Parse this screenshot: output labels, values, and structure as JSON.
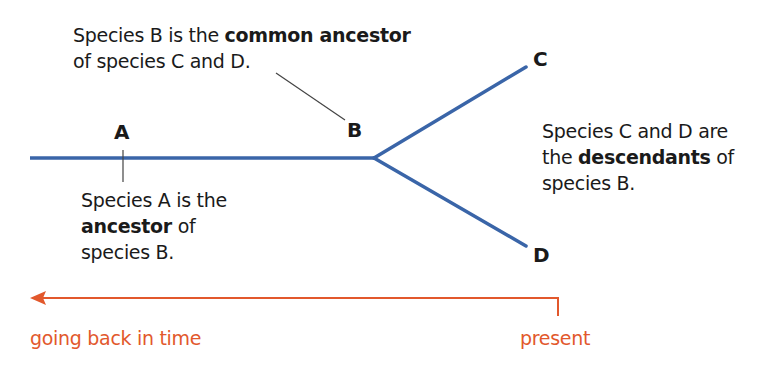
{
  "colors": {
    "branch": "#3a65a8",
    "time_arrow": "#e2582c",
    "leader": "#444444",
    "text": "#1a1a1a"
  },
  "nodes": {
    "A": {
      "label": "A"
    },
    "B": {
      "label": "B"
    },
    "C": {
      "label": "C"
    },
    "D": {
      "label": "D"
    }
  },
  "annotations": {
    "b_common": {
      "line1_pre": "Species B is the ",
      "line1_bold": "common ancestor",
      "line2": "of species C and D."
    },
    "a_ancestor": {
      "line1": "Species A is the",
      "line2_bold": "ancestor",
      "line2_post": " of",
      "line3": "species B."
    },
    "cd_descendants": {
      "line1": "Species C and D are",
      "line2_pre": "the ",
      "line2_bold": "descendants",
      "line2_post": " of",
      "line3": "species B."
    }
  },
  "timeline": {
    "left_label": "going back in time",
    "right_label": "present"
  }
}
